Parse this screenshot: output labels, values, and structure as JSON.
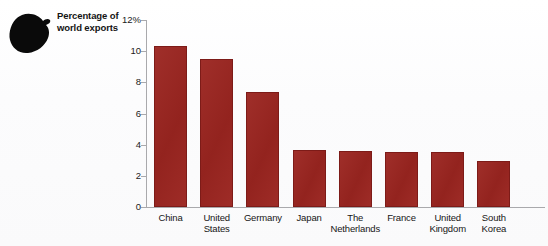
{
  "caption": {
    "line1": "Percentage of",
    "line2": "world exports"
  },
  "decoration": {
    "blob_icon": "ink-blob-icon",
    "blob_color": "#0a0a0a"
  },
  "colors": {
    "bar_fill": "#9b2520",
    "bar_stroke": "#7d1b18",
    "axis_line": "#a9a9ac",
    "text": "#161616",
    "background": "#fdfdfd"
  },
  "chart_data": {
    "type": "bar",
    "title": "Percentage of world exports",
    "xlabel": "",
    "ylabel": "Percentage of world exports",
    "ylim": [
      0,
      12
    ],
    "yticks": [
      0,
      2,
      4,
      6,
      8,
      10,
      12
    ],
    "ytick_labels": [
      "0",
      "2",
      "4",
      "6",
      "8",
      "10",
      "12%"
    ],
    "grid": false,
    "legend": false,
    "categories": [
      "China",
      "United States",
      "Germany",
      "Japan",
      "The Netherlands",
      "France",
      "United Kingdom",
      "South Korea"
    ],
    "category_lines": [
      [
        "China"
      ],
      [
        "United",
        "States"
      ],
      [
        "Germany"
      ],
      [
        "Japan"
      ],
      [
        "The",
        "Netherlands"
      ],
      [
        "France"
      ],
      [
        "United",
        "Kingdom"
      ],
      [
        "South",
        "Korea"
      ]
    ],
    "values": [
      10.3,
      9.5,
      7.4,
      3.65,
      3.6,
      3.55,
      3.5,
      2.95
    ]
  }
}
